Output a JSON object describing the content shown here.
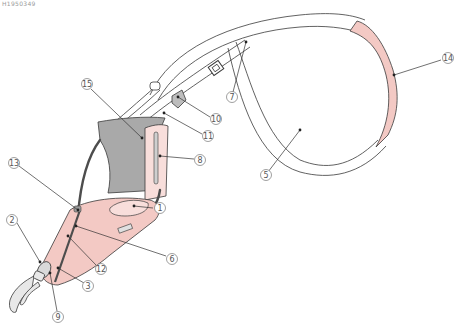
{
  "figure": {
    "code_label": "H1950349",
    "colors": {
      "outline": "#3a3a3a",
      "pink": "#f3c9c4",
      "pink_light": "#f8dedb",
      "gray_panel": "#a9a9a9",
      "gray_strap": "#6d6d6d",
      "white": "#ffffff",
      "leader": "#333333",
      "callout_ring": "#777777"
    },
    "callouts": [
      {
        "id": "1",
        "label": "1",
        "x": 160,
        "y": 208,
        "tx": 134,
        "ty": 206
      },
      {
        "id": "2",
        "label": "2",
        "x": 12,
        "y": 220,
        "tx": 40,
        "ty": 262
      },
      {
        "id": "3",
        "label": "3",
        "x": 88,
        "y": 286,
        "tx": 58,
        "ty": 268
      },
      {
        "id": "5",
        "label": "5",
        "x": 266,
        "y": 175,
        "tx": 300,
        "ty": 130
      },
      {
        "id": "6",
        "label": "6",
        "x": 172,
        "y": 259,
        "tx": 76,
        "ty": 226
      },
      {
        "id": "7",
        "label": "7",
        "x": 232,
        "y": 97,
        "tx": 246,
        "ty": 42
      },
      {
        "id": "8",
        "label": "8",
        "x": 200,
        "y": 160,
        "tx": 160,
        "ty": 156
      },
      {
        "id": "9",
        "label": "9",
        "x": 58,
        "y": 317,
        "tx": 50,
        "ty": 273
      },
      {
        "id": "10",
        "label": "10",
        "x": 216,
        "y": 119,
        "tx": 178,
        "ty": 97
      },
      {
        "id": "11",
        "label": "11",
        "x": 208,
        "y": 136,
        "tx": 164,
        "ty": 113
      },
      {
        "id": "12",
        "label": "12",
        "x": 101,
        "y": 269,
        "tx": 68,
        "ty": 236
      },
      {
        "id": "13",
        "label": "13",
        "x": 14,
        "y": 163,
        "tx": 78,
        "ty": 210
      },
      {
        "id": "14",
        "label": "14",
        "x": 448,
        "y": 58,
        "tx": 394,
        "ty": 75
      },
      {
        "id": "15",
        "label": "15",
        "x": 87,
        "y": 84,
        "tx": 142,
        "ty": 138
      }
    ]
  }
}
